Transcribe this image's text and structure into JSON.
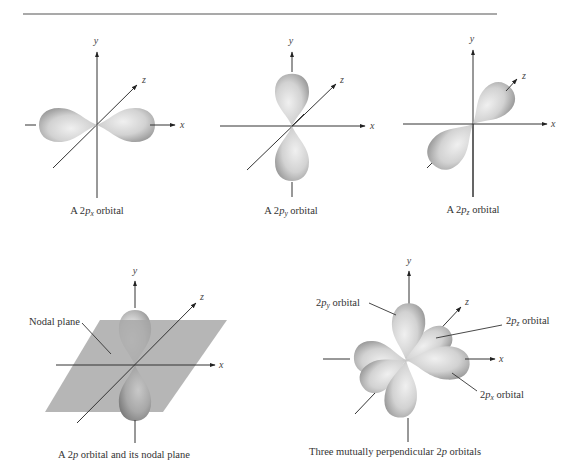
{
  "figure": {
    "panels": [
      {
        "id": "2px",
        "axis_labels": {
          "x": "x",
          "y": "y",
          "z": "z"
        },
        "caption": {
          "prefix": "A 2",
          "p": "p",
          "sub": "x",
          "suffix": " orbital"
        }
      },
      {
        "id": "2py",
        "axis_labels": {
          "x": "x",
          "y": "y",
          "z": "z"
        },
        "caption": {
          "prefix": "A 2",
          "p": "p",
          "sub": "y",
          "suffix": " orbital"
        }
      },
      {
        "id": "2pz",
        "axis_labels": {
          "x": "x",
          "y": "y",
          "z": "z"
        },
        "caption": {
          "prefix": "A 2",
          "p": "p",
          "sub": "z",
          "suffix": " orbital"
        }
      },
      {
        "id": "nodal",
        "axis_labels": {
          "x": "x",
          "y": "y",
          "z": "z"
        },
        "annotation": "Nodal plane",
        "caption": {
          "prefix": "A 2",
          "p": "p",
          "sub": "",
          "suffix": " orbital and its nodal plane"
        }
      },
      {
        "id": "three",
        "axis_labels": {
          "x": "x",
          "y": "y",
          "z": "z"
        },
        "annotations": {
          "py": {
            "prefix": "2",
            "p": "p",
            "sub": "y",
            "suffix": " orbital"
          },
          "pz": {
            "prefix": "2",
            "p": "p",
            "sub": "z",
            "suffix": " orbital"
          },
          "px": {
            "prefix": "2",
            "p": "p",
            "sub": "x",
            "suffix": " orbital"
          }
        },
        "caption": {
          "prefix": "Three mutually perpendicular 2",
          "p": "p",
          "sub": "",
          "suffix": " orbitals"
        }
      }
    ],
    "colors": {
      "lobe_light": "#ececec",
      "lobe_dark": "#9a9a9a",
      "plane": "#a8a8a8",
      "axis": "#333333",
      "rule": "#555555"
    }
  }
}
